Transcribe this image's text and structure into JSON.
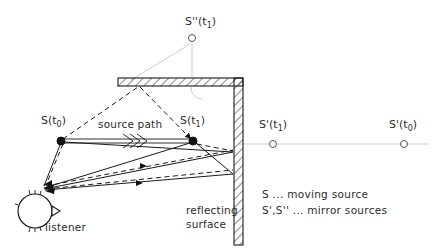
{
  "figure": {
    "background_color": "#ffffff",
    "line_color": "#1a1a1a",
    "faint_color": "#cfcfcf",
    "text_color": "#2b2b2b"
  },
  "labels": {
    "source_t0": "S(t",
    "source_t0_sub": "0",
    "source_t0_close": ")",
    "source_t1": "S(t",
    "source_t1_sub": "1",
    "source_t1_close": ")",
    "mirror_prime_t1": "S'(t",
    "mirror_prime_t1_sub": "1",
    "mirror_prime_t1_close": ")",
    "mirror_prime_t0": "S'(t",
    "mirror_prime_t0_sub": "0",
    "mirror_prime_t0_close": ")",
    "mirror_dprime_t1": "S''(t",
    "mirror_dprime_t1_sub": "1",
    "mirror_dprime_t1_close": ")",
    "source_path": "source  path",
    "listener": "listener",
    "reflecting_line1": "reflecting",
    "reflecting_line2": "surface"
  },
  "legend": {
    "line1": "S ... moving  source",
    "line2": "S',S'' ... mirror  sources"
  },
  "markers": {
    "source_t0": {
      "x": 61,
      "y": 141,
      "type": "filled-dot",
      "r": 4
    },
    "source_t1": {
      "x": 193,
      "y": 141,
      "type": "filled-dot",
      "r": 4
    },
    "mirror_prime_t1": {
      "x": 273,
      "y": 144,
      "type": "open-circle",
      "r": 3.5
    },
    "mirror_prime_t0": {
      "x": 404,
      "y": 144,
      "type": "open-circle",
      "r": 3.5
    },
    "mirror_dprime_t1": {
      "x": 192,
      "y": 38,
      "type": "open-circle",
      "r": 3.5
    },
    "listener_head": {
      "x": 35,
      "y": 211,
      "r": 17
    }
  },
  "geometry": {
    "wall_x": 234,
    "wall_top_y": 78,
    "wall_bottom_y": 245,
    "wall_thickness": 9,
    "ceiling_left_x": 118,
    "ceiling_right_x": 243,
    "ceiling_top_y": 78,
    "ceiling_thickness": 8,
    "listener_ear_x": 42,
    "listener_ear_y": 186,
    "ceiling_bounce_x": 140,
    "ceiling_bounce_y": 86
  },
  "icons": {
    "source_path_arrow": "double-line-arrow-icon",
    "right_angle_marker": "right-angle-arc-icon",
    "listener_head": "listener-head-icon"
  }
}
